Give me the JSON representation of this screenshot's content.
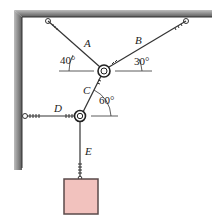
{
  "figure": {
    "cables": [
      {
        "label": "A",
        "angle_label": "40°"
      },
      {
        "label": "B",
        "angle_label": "30°"
      },
      {
        "label": "C",
        "angle_label": "60°"
      },
      {
        "label": "D"
      },
      {
        "label": "E"
      }
    ],
    "colors": {
      "wall": "#6e6e6e",
      "cable": "#333333",
      "block_fill": "#f2c2be",
      "block_stroke": "#5a4a4a"
    }
  }
}
